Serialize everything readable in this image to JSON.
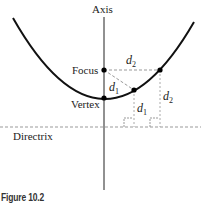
{
  "diagram": {
    "labels": {
      "axis": "Axis",
      "focus": "Focus",
      "vertex": "Vertex",
      "directrix": "Directrix",
      "d1_main": "d",
      "d1_sub": "1",
      "d2_main": "d",
      "d2_sub": "2"
    },
    "points": {
      "vertex": [
        104,
        98
      ],
      "focus": [
        104,
        70
      ],
      "p1": [
        134,
        90
      ],
      "p2": [
        160,
        70
      ]
    },
    "directrix_y": 127,
    "colors": {
      "stroke": "#111111",
      "dashed": "#999999"
    }
  },
  "caption": "Figure 10.2"
}
